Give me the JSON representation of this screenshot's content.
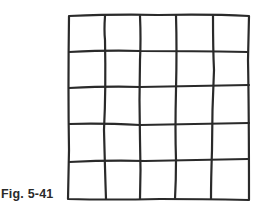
{
  "figure": {
    "caption": "Fig. 5-41",
    "rows": 5,
    "columns": 5,
    "line_color": "#2a2a2a"
  }
}
